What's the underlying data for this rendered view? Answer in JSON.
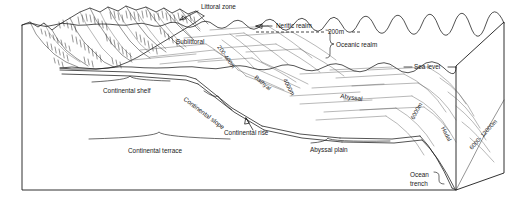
{
  "figure": {
    "type": "block-diagram",
    "style": "pen-and-ink line drawing, black on white",
    "line_color": "#1a1a1a",
    "background_color": "#ffffff"
  },
  "labels": {
    "littoral_zone": "Littoral zone",
    "neritic_realm": "Neritic realm",
    "oceanic_realm": "Oceanic realm",
    "depth_200m": "200m",
    "sublittoral": "Sublittoral",
    "depth_200_400m": "200-400m",
    "sea_level": "Sea   level",
    "continental_shelf": "Continental shelf",
    "continental_slope": "Continental slope",
    "continental_rise": "Continental rise",
    "continental_terrace": "Continental terrace",
    "bathyal": "Bathyal",
    "depth_4000m": "4000m",
    "abyssal": "Abyssal",
    "abyssal_plain": "Abyssal plain",
    "depth_6000m": "6000m",
    "hadal": "Hadal",
    "ocean_trench_line1": "Ocean",
    "ocean_trench_line2": "trench",
    "depth_6000_12000m": "6000- 12000m"
  },
  "zones": [
    {
      "name": "Littoral zone",
      "region": "shoreline",
      "depth": "intertidal"
    },
    {
      "name": "Sublittoral",
      "region": "continental shelf",
      "depth": "0-200 m"
    },
    {
      "name": "Bathyal",
      "region": "continental slope",
      "depth": "200-4000 m"
    },
    {
      "name": "Abyssal",
      "region": "abyssal plain",
      "depth": "4000-6000 m"
    },
    {
      "name": "Hadal",
      "region": "ocean trench",
      "depth": "6000-12000 m"
    }
  ],
  "realms": [
    {
      "name": "Neritic realm",
      "extent": "shoreline to 200 m depth"
    },
    {
      "name": "Oceanic realm",
      "extent": "seaward of the 200 m isobath"
    }
  ],
  "depth_contours": [
    "200m",
    "200-400m",
    "4000m",
    "6000m",
    "6000- 12000m"
  ],
  "physiographic_features": [
    "Continental shelf",
    "Continental slope",
    "Continental rise",
    "Continental terrace",
    "Abyssal plain",
    "Ocean trench"
  ]
}
